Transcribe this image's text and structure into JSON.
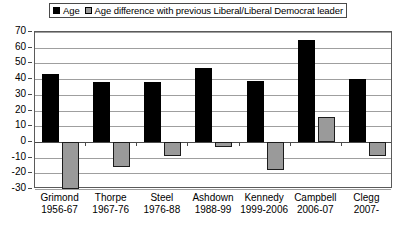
{
  "chart_data": {
    "type": "bar",
    "title": "",
    "subtitle": "",
    "xlabel": "",
    "ylabel": "",
    "ylim": [
      -30,
      70
    ],
    "ytick_step": 10,
    "yticks": [
      70,
      60,
      50,
      40,
      30,
      20,
      10,
      0,
      -10,
      -20,
      -30
    ],
    "ytick_labels": [
      "70",
      "60",
      "50",
      "40",
      "30",
      "20",
      "10",
      "0",
      "-10",
      "-20",
      "-30"
    ],
    "grid": true,
    "legend_position": "top",
    "categories": [
      "Grimond",
      "Thorpe",
      "Steel",
      "Ashdown",
      "Kennedy",
      "Campbell",
      "Clegg"
    ],
    "category_sublabels": [
      "1956-67",
      "1967-76",
      "1976-88",
      "1988-99",
      "1999-2006",
      "2006-07",
      "2007-"
    ],
    "series": [
      {
        "name": "Age",
        "color": "#000000",
        "values": [
          43,
          38,
          38,
          47,
          39,
          65,
          40
        ]
      },
      {
        "name": "Age difference with previous Liberal/Liberal Democrat leader",
        "color": "#9a9a9a",
        "values": [
          -30,
          -16,
          -9,
          -3,
          -18,
          16,
          -9
        ]
      }
    ]
  },
  "legend": {
    "entries": [
      {
        "label": "Age",
        "swatch": "black-square-icon"
      },
      {
        "label": "Age difference with previous Liberal/Liberal Democrat leader",
        "swatch": "grey-square-icon"
      }
    ]
  }
}
